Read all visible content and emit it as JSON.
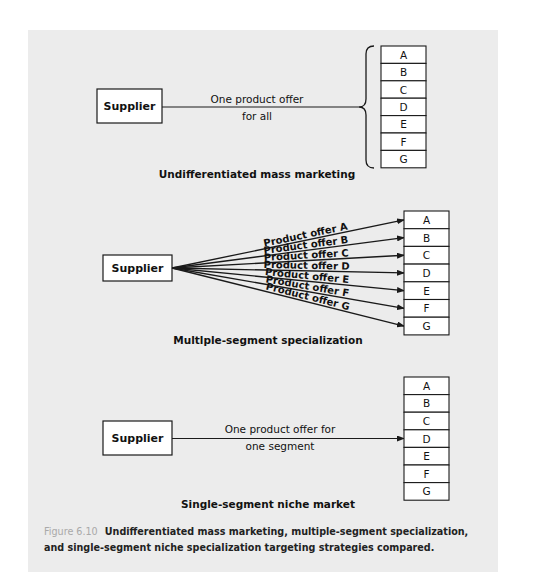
{
  "segments": [
    "A",
    "B",
    "C",
    "D",
    "E",
    "F",
    "G"
  ],
  "sections": [
    {
      "id": "undifferentiated",
      "supplier_label": "Supplier",
      "connector_text": [
        "One product offer",
        "for all"
      ],
      "title": "Undifferentiated mass marketing"
    },
    {
      "id": "multiple-segment",
      "supplier_label": "Supplier",
      "offers": [
        "Product offer A",
        "Product offer B",
        "Product offer C",
        "Product offer D",
        "Product offer E",
        "Product offer F",
        "Product offer G"
      ],
      "title": "Multlple-segment specialization"
    },
    {
      "id": "single-segment",
      "supplier_label": "Supplier",
      "connector_text": [
        "One product offer for",
        "one segment"
      ],
      "target_segment": "D",
      "title": "Single-segment niche market"
    }
  ],
  "caption": {
    "figure_label": "Figure 6.10",
    "text": "Undifferentiated mass marketing, multiple-segment specialization, and single-segment niche specialization targeting strategies compared."
  },
  "colors": {
    "panel_bg": "#ececec",
    "line": "#1a1a1a",
    "box_fill": "#ffffff",
    "caption_label": "#a9a9a9"
  }
}
